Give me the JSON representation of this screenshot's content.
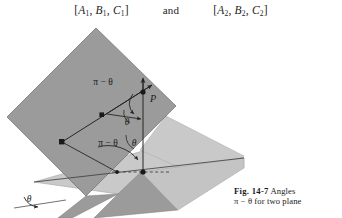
{
  "formula_line": {
    "left_set": "[A1, B1, C1]",
    "left_parts": {
      "open": "[",
      "a": "A",
      "a_sub": "1",
      "b": "B",
      "b_sub": "1",
      "c": "C",
      "c_sub": "1",
      "close": "]"
    },
    "conjunction": "and",
    "right_set": "[A2, B2, C2]",
    "right_parts": {
      "open": "[",
      "a": "A",
      "a_sub": "2",
      "b": "B",
      "b_sub": "2",
      "c": "C",
      "c_sub": "2",
      "close": "]"
    },
    "comma": ","
  },
  "figure": {
    "point_label": "P",
    "angle_labels": {
      "upper_supplement": "π − θ",
      "upper_theta": "θ",
      "mid_theta": "θ",
      "lower_supplement": "π − θ",
      "bottom_theta": "θ"
    },
    "colors": {
      "plane_dark": "#9b9b9b",
      "plane_light": "#c9c9c9",
      "plane_light_shadow": "#b4b4b4",
      "line": "#2a2a2a",
      "background": "#ffffff"
    }
  },
  "caption": {
    "figure_number": "Fig. 14-7",
    "line1_rest": "Angles",
    "line2": "π − θ for two plane",
    "theta_symbol": "θ",
    "pi_symbol": "π"
  }
}
